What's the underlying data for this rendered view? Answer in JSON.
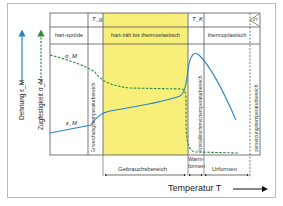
{
  "diagram": {
    "y_axis_labels": {
      "strain": "Dehnung ε_M",
      "strength": "Zugfestigkeit σ_M"
    },
    "header_row1": {
      "tg": "T_g",
      "tk": "T_K",
      "zt": "ZT"
    },
    "header_row2": {
      "hart_sproede": "hart-spröde",
      "hart_zaeh": "hart-zäh bis thermoelastisch",
      "thermoplastisch": "thermoplastisch"
    },
    "vertical_labels": {
      "erweichung": "Erweichungstemperaturbereich",
      "kristallit": "Kristallitschmelztemperaturbereich",
      "zersetzung": "zersetzungstemperaturbereich"
    },
    "curve_labels": {
      "sigma": "σ_M",
      "epsilon": "ε_M"
    },
    "ranges": {
      "gebrauch": "Gebrauchsbereich",
      "warm_1": "Warm-",
      "warm_2": "formen",
      "urformen": "Urformen"
    },
    "x_axis_title": "Temperatur T",
    "colors": {
      "strain_curve": "#2a86c2",
      "strength_curve": "#2e8b3a",
      "yellow_region": "#f7ef7a",
      "grid": "#555555"
    }
  }
}
